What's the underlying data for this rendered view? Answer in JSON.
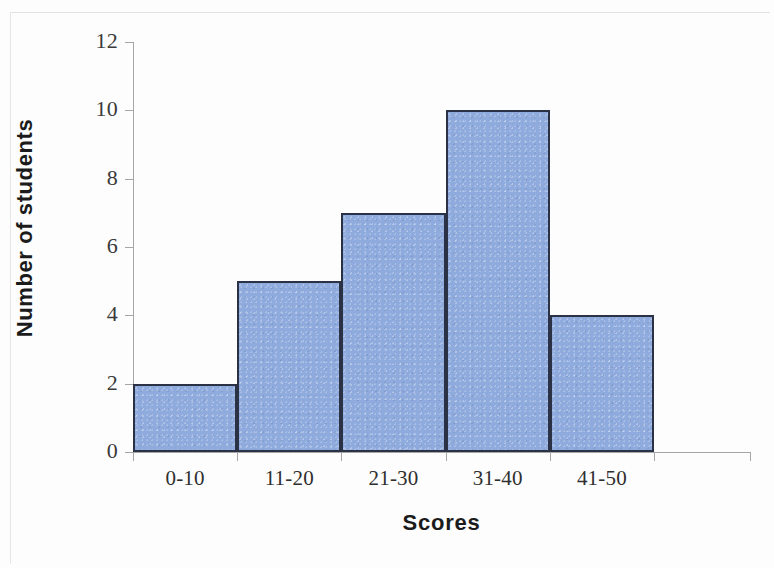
{
  "chart_data": {
    "type": "bar",
    "title": "",
    "categories": [
      "0-10",
      "11-20",
      "21-30",
      "31-40",
      "41-50"
    ],
    "values": [
      2,
      5,
      7,
      10,
      4
    ],
    "xlabel": "Scores",
    "ylabel": "Number of students",
    "ylim": [
      0,
      12
    ],
    "yticks": [
      0,
      2,
      4,
      6,
      8,
      10,
      12
    ],
    "ytick_labels": [
      "0",
      "2",
      "4",
      "6",
      "8",
      "10",
      "12"
    ],
    "grid": false,
    "legend": null,
    "series": [
      {
        "name": "Number of students",
        "values": [
          2,
          5,
          7,
          10,
          4
        ]
      }
    ],
    "colors": {
      "bar_fill": "#8faadc",
      "bar_border": "#2b3245",
      "axis": "#a6a6a6",
      "text": "#1b1b1b",
      "background": "#ffffff"
    }
  }
}
